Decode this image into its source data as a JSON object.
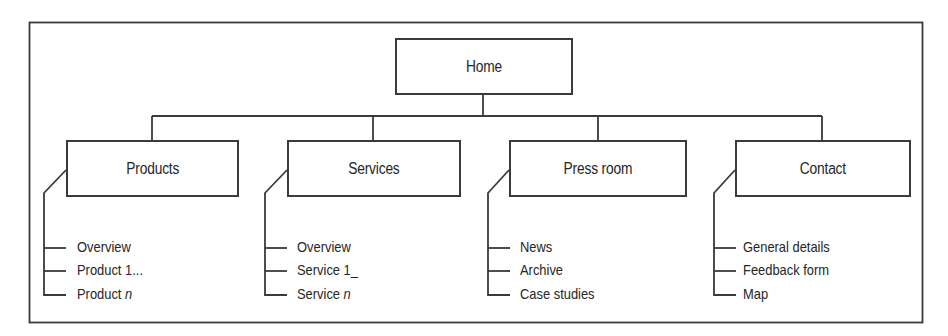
{
  "diagram": {
    "type": "site-map",
    "root": {
      "label": "Home"
    },
    "sections": [
      {
        "label": "Products",
        "children": [
          "Overview",
          "Product 1...",
          "Product n"
        ]
      },
      {
        "label": "Services",
        "children": [
          "Overview",
          "Service 1_",
          "Service n"
        ]
      },
      {
        "label": "Press room",
        "children": [
          "News",
          "Archive",
          "Case studies"
        ]
      },
      {
        "label": "Contact",
        "children": [
          "General details",
          "Feedback form",
          "Map"
        ]
      }
    ],
    "colors": {
      "line": "#3a3a3a",
      "text": "#262626",
      "background": "#ffffff"
    }
  },
  "labels": {
    "home": "Home",
    "products": "Products",
    "services": "Services",
    "press_room": "Press room",
    "contact": "Contact",
    "products_items": {
      "overview": "Overview",
      "product1": "Product 1...",
      "productn_prefix": "Product ",
      "productn_var": "n"
    },
    "services_items": {
      "overview": "Overview",
      "service1": "Service 1_",
      "servicen_prefix": "Service ",
      "servicen_var": "n"
    },
    "press_items": {
      "news": "News",
      "archive": "Archive",
      "case_studies": "Case studies"
    },
    "contact_items": {
      "general": "General details",
      "feedback": "Feedback form",
      "map": "Map"
    }
  }
}
